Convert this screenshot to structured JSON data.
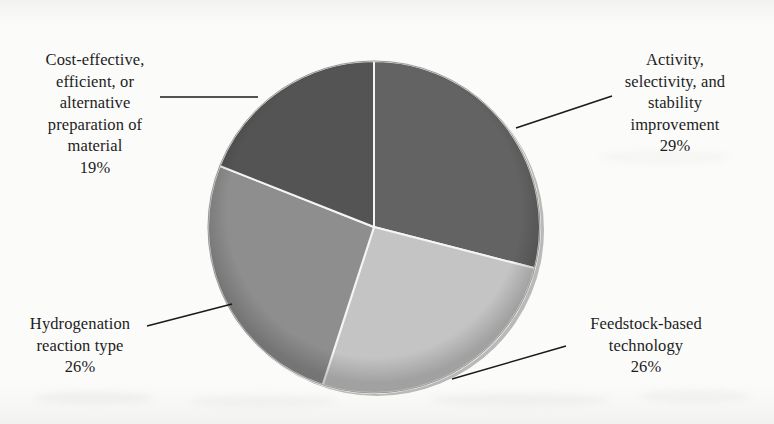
{
  "figure": {
    "background_color": "#fbfbfa",
    "text_color": "#1d1d1d",
    "leader_line_color": "#1a1a1a"
  },
  "chart_data": {
    "type": "pie",
    "title": "",
    "subtitle": "",
    "xlabel": "",
    "ylabel": "",
    "legend_position": "none",
    "grid": false,
    "units": "percent",
    "total": 100,
    "start_angle_deg": 0,
    "direction": "clockwise",
    "categories": [
      "Activity, selectivity, and stability improvement",
      "Feedstock-based technology",
      "Hydrogenation reaction type",
      "Cost-effective, efficient, or alternative preparation of material"
    ],
    "values": [
      29,
      26,
      26,
      19
    ],
    "colors": [
      "#636363",
      "#c4c4c4",
      "#8e8e8e",
      "#545454"
    ],
    "slices": [
      {
        "name": "Activity, selectivity, and stability improvement",
        "value": 29,
        "value_label": "29%",
        "color": "#636363",
        "label_lines": [
          "Activity,",
          "selectivity, and",
          "stability",
          "improvement"
        ],
        "label_text": "Activity,\nselectivity, and\nstability\nimprovement"
      },
      {
        "name": "Feedstock-based technology",
        "value": 26,
        "value_label": "26%",
        "color": "#c4c4c4",
        "label_lines": [
          "Feedstock-based",
          "technology"
        ],
        "label_text": "Feedstock-based\ntechnology"
      },
      {
        "name": "Hydrogenation reaction type",
        "value": 26,
        "value_label": "26%",
        "color": "#8e8e8e",
        "label_lines": [
          "Hydrogenation",
          "reaction type"
        ],
        "label_text": "Hydrogenation\nreaction type"
      },
      {
        "name": "Cost-effective, efficient, or alternative preparation of material",
        "value": 19,
        "value_label": "19%",
        "color": "#545454",
        "label_lines": [
          "Cost-effective,",
          "efficient, or",
          "alternative",
          "preparation of",
          "material"
        ],
        "label_text": "Cost-effective,\nefficient, or\nalternative\npreparation of\nmaterial"
      }
    ]
  }
}
